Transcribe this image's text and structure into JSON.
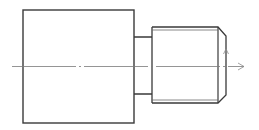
{
  "drawing": {
    "title": "Shaft with threaded end - side view",
    "colors": {
      "outline": "#3a3a3a",
      "thin": "#6a6a6a",
      "centerline": "#7a7a7a",
      "background": "#ffffff"
    },
    "body": {
      "x": 23,
      "y": 10,
      "width": 111,
      "height": 113
    },
    "neck": {
      "x": 134,
      "y": 37,
      "width": 18,
      "height": 57
    },
    "thread": {
      "x": 152,
      "y": 27,
      "end_x": 218,
      "height": 76,
      "minor_offset": 3,
      "chamfer": {
        "x_end": 226,
        "top_y": 36,
        "bottom_y": 95
      }
    },
    "centerline": {
      "y": 66.5,
      "x_start": 12,
      "x_end": 244
    },
    "arrows": [
      {
        "name": "axis-arrow-right",
        "direction": "right",
        "x": 244,
        "y": 66.5
      },
      {
        "name": "radial-arrow-up",
        "direction": "up",
        "x": 226,
        "y": 49
      }
    ]
  }
}
